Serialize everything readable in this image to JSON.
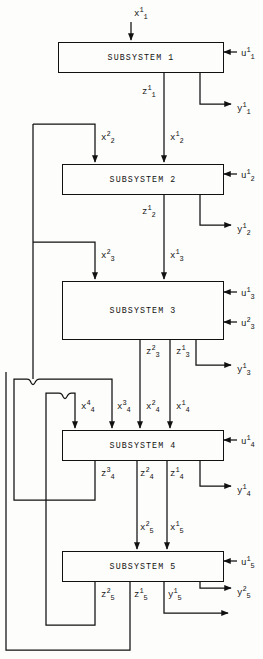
{
  "diagram": {
    "type": "block-diagram",
    "stroke_color": "#111111",
    "background_color": "#fdfdfb",
    "blocks": [
      {
        "id": "s1",
        "label": "SUBSYSTEM 1",
        "x": 58,
        "y": 42,
        "w": 164,
        "h": 29
      },
      {
        "id": "s2",
        "label": "SUBSYSTEM 2",
        "x": 62,
        "y": 164,
        "w": 160,
        "h": 29
      },
      {
        "id": "s3",
        "label": "SUBSYSTEM 3",
        "x": 62,
        "y": 281,
        "w": 160,
        "h": 57
      },
      {
        "id": "s4",
        "label": "SUBSYSTEM 4",
        "x": 62,
        "y": 430,
        "w": 160,
        "h": 29
      },
      {
        "id": "s5",
        "label": "SUBSYSTEM 5",
        "x": 62,
        "y": 551,
        "w": 160,
        "h": 29
      }
    ],
    "labels": [
      {
        "name": "label-x1-1",
        "base": "x",
        "sup": "1",
        "sub": "1",
        "x": 134,
        "y": 10
      },
      {
        "name": "label-u1-1",
        "base": "u",
        "sup": "1",
        "sub": "1",
        "x": 241,
        "y": 50
      },
      {
        "name": "label-z1-1",
        "base": "z",
        "sup": "1",
        "sub": "1",
        "x": 142,
        "y": 88
      },
      {
        "name": "label-y1-1",
        "base": "y",
        "sup": "1",
        "sub": "1",
        "x": 237,
        "y": 105
      },
      {
        "name": "label-x2-2",
        "base": "x",
        "sup": "2",
        "sub": "2",
        "x": 101,
        "y": 134
      },
      {
        "name": "label-x2-1",
        "base": "x",
        "sup": "1",
        "sub": "2",
        "x": 170,
        "y": 134
      },
      {
        "name": "label-u2-1",
        "base": "u",
        "sup": "1",
        "sub": "2",
        "x": 241,
        "y": 172
      },
      {
        "name": "label-z2-1",
        "base": "z",
        "sup": "1",
        "sub": "2",
        "x": 142,
        "y": 208
      },
      {
        "name": "label-y2-1",
        "base": "y",
        "sup": "1",
        "sub": "2",
        "x": 237,
        "y": 226
      },
      {
        "name": "label-x3-2",
        "base": "x",
        "sup": "2",
        "sub": "3",
        "x": 101,
        "y": 252
      },
      {
        "name": "label-x3-1",
        "base": "x",
        "sup": "1",
        "sub": "3",
        "x": 170,
        "y": 252
      },
      {
        "name": "label-u3-1",
        "base": "u",
        "sup": "1",
        "sub": "3",
        "x": 241,
        "y": 290
      },
      {
        "name": "label-u3-2",
        "base": "u",
        "sup": "2",
        "sub": "3",
        "x": 241,
        "y": 320
      },
      {
        "name": "label-z3-2",
        "base": "z",
        "sup": "2",
        "sub": "3",
        "x": 146,
        "y": 348
      },
      {
        "name": "label-z3-1",
        "base": "z",
        "sup": "1",
        "sub": "3",
        "x": 176,
        "y": 348
      },
      {
        "name": "label-y3-1",
        "base": "y",
        "sup": "1",
        "sub": "3",
        "x": 237,
        "y": 366
      },
      {
        "name": "label-x4-4",
        "base": "x",
        "sup": "4",
        "sub": "4",
        "x": 81,
        "y": 403
      },
      {
        "name": "label-x4-3",
        "base": "x",
        "sup": "3",
        "sub": "4",
        "x": 117,
        "y": 403
      },
      {
        "name": "label-x4-2",
        "base": "x",
        "sup": "2",
        "sub": "4",
        "x": 146,
        "y": 403
      },
      {
        "name": "label-x4-1",
        "base": "x",
        "sup": "1",
        "sub": "4",
        "x": 176,
        "y": 403
      },
      {
        "name": "label-u4-1",
        "base": "u",
        "sup": "1",
        "sub": "4",
        "x": 241,
        "y": 438
      },
      {
        "name": "label-z4-3",
        "base": "z",
        "sup": "3",
        "sub": "4",
        "x": 101,
        "y": 470
      },
      {
        "name": "label-z4-2",
        "base": "z",
        "sup": "2",
        "sub": "4",
        "x": 140,
        "y": 470
      },
      {
        "name": "label-z4-1",
        "base": "z",
        "sup": "1",
        "sub": "4",
        "x": 170,
        "y": 470
      },
      {
        "name": "label-y4-1",
        "base": "y",
        "sup": "1",
        "sub": "4",
        "x": 237,
        "y": 487
      },
      {
        "name": "label-x5-2",
        "base": "x",
        "sup": "2",
        "sub": "5",
        "x": 140,
        "y": 524
      },
      {
        "name": "label-x5-1",
        "base": "x",
        "sup": "1",
        "sub": "5",
        "x": 170,
        "y": 524
      },
      {
        "name": "label-u5-1",
        "base": "u",
        "sup": "1",
        "sub": "5",
        "x": 241,
        "y": 559
      },
      {
        "name": "label-z5-2",
        "base": "z",
        "sup": "2",
        "sub": "5",
        "x": 101,
        "y": 591
      },
      {
        "name": "label-z5-1",
        "base": "z",
        "sup": "1",
        "sub": "5",
        "x": 134,
        "y": 591
      },
      {
        "name": "label-y5-1",
        "base": "y",
        "sup": "1",
        "sub": "5",
        "x": 168,
        "y": 591
      },
      {
        "name": "label-y5-2",
        "base": "y",
        "sup": "2",
        "sub": "5",
        "x": 237,
        "y": 589
      }
    ]
  }
}
